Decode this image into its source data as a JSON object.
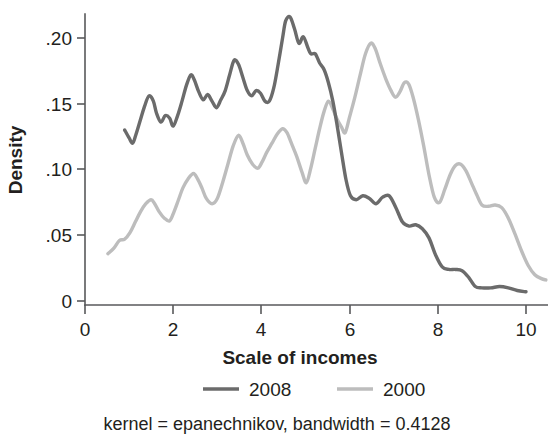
{
  "chart_data": {
    "type": "line",
    "title": "",
    "subtitle": "",
    "xlabel": "Scale of incomes",
    "ylabel": "Density",
    "caption": "kernel = epanechnikov, bandwidth = 0.4128",
    "xlim": [
      0,
      10.6
    ],
    "ylim": [
      0,
      0.225
    ],
    "grid": false,
    "legend_position": "bottom",
    "x_ticks": [
      0,
      2,
      4,
      6,
      8,
      10
    ],
    "x_tick_labels": [
      "0",
      "2",
      "4",
      "6",
      "8",
      "10"
    ],
    "y_ticks": [
      0,
      0.05,
      0.1,
      0.15,
      0.2
    ],
    "y_tick_labels": [
      "0",
      ".05",
      ".10",
      ".15",
      ".20"
    ],
    "series": [
      {
        "name": "2008",
        "color": "#6b6b6b",
        "width": 3.4,
        "x": [
          0.9,
          1.0,
          1.08,
          1.15,
          1.25,
          1.35,
          1.45,
          1.55,
          1.62,
          1.72,
          1.82,
          1.92,
          2.0,
          2.1,
          2.2,
          2.3,
          2.4,
          2.48,
          2.58,
          2.68,
          2.78,
          2.88,
          2.98,
          3.08,
          3.18,
          3.28,
          3.38,
          3.48,
          3.58,
          3.68,
          3.78,
          3.88,
          3.98,
          4.08,
          4.18,
          4.28,
          4.38,
          4.48,
          4.55,
          4.65,
          4.75,
          4.85,
          4.95,
          5.05,
          5.12,
          5.22,
          5.32,
          5.42,
          5.52,
          5.62,
          5.72,
          5.82,
          5.92,
          6.02,
          6.15,
          6.3,
          6.45,
          6.6,
          6.75,
          6.9,
          7.05,
          7.2,
          7.35,
          7.5,
          7.65,
          7.8,
          7.95,
          8.1,
          8.25,
          8.4,
          8.55,
          8.7,
          8.85,
          9.0,
          9.2,
          9.4,
          9.6,
          9.8,
          10.0
        ],
        "y": [
          0.13,
          0.124,
          0.12,
          0.126,
          0.137,
          0.148,
          0.156,
          0.152,
          0.143,
          0.136,
          0.141,
          0.139,
          0.133,
          0.141,
          0.152,
          0.164,
          0.172,
          0.168,
          0.159,
          0.153,
          0.157,
          0.152,
          0.147,
          0.153,
          0.16,
          0.172,
          0.183,
          0.18,
          0.17,
          0.16,
          0.156,
          0.16,
          0.158,
          0.152,
          0.152,
          0.162,
          0.18,
          0.2,
          0.213,
          0.216,
          0.207,
          0.196,
          0.201,
          0.193,
          0.188,
          0.188,
          0.181,
          0.176,
          0.166,
          0.152,
          0.133,
          0.112,
          0.092,
          0.08,
          0.077,
          0.08,
          0.078,
          0.074,
          0.079,
          0.08,
          0.071,
          0.06,
          0.057,
          0.058,
          0.055,
          0.048,
          0.035,
          0.026,
          0.024,
          0.024,
          0.023,
          0.018,
          0.011,
          0.01,
          0.01,
          0.011,
          0.01,
          0.008,
          0.007
        ]
      },
      {
        "name": "2000",
        "color": "#bdbdbd",
        "width": 3.4,
        "x": [
          0.52,
          0.65,
          0.78,
          0.9,
          1.02,
          1.14,
          1.26,
          1.38,
          1.5,
          1.58,
          1.68,
          1.8,
          1.92,
          2.02,
          2.12,
          2.22,
          2.34,
          2.46,
          2.55,
          2.65,
          2.75,
          2.88,
          3.0,
          3.12,
          3.24,
          3.36,
          3.48,
          3.58,
          3.68,
          3.8,
          3.92,
          4.02,
          4.12,
          4.24,
          4.36,
          4.48,
          4.58,
          4.68,
          4.8,
          4.92,
          5.02,
          5.12,
          5.22,
          5.32,
          5.42,
          5.52,
          5.62,
          5.72,
          5.82,
          5.9,
          6.0,
          6.12,
          6.24,
          6.36,
          6.48,
          6.58,
          6.7,
          6.82,
          6.94,
          7.04,
          7.14,
          7.24,
          7.34,
          7.44,
          7.56,
          7.68,
          7.8,
          7.92,
          8.04,
          8.16,
          8.28,
          8.4,
          8.52,
          8.64,
          8.76,
          8.88,
          9.0,
          9.15,
          9.3,
          9.45,
          9.6,
          9.75,
          9.9,
          10.05,
          10.2,
          10.35,
          10.45
        ],
        "y": [
          0.036,
          0.04,
          0.046,
          0.047,
          0.052,
          0.06,
          0.068,
          0.074,
          0.077,
          0.074,
          0.068,
          0.063,
          0.061,
          0.068,
          0.077,
          0.086,
          0.093,
          0.097,
          0.093,
          0.086,
          0.078,
          0.074,
          0.078,
          0.09,
          0.104,
          0.118,
          0.126,
          0.12,
          0.111,
          0.104,
          0.101,
          0.106,
          0.113,
          0.12,
          0.127,
          0.131,
          0.128,
          0.12,
          0.11,
          0.098,
          0.09,
          0.101,
          0.116,
          0.131,
          0.144,
          0.152,
          0.146,
          0.138,
          0.132,
          0.128,
          0.14,
          0.155,
          0.172,
          0.188,
          0.196,
          0.192,
          0.18,
          0.169,
          0.16,
          0.155,
          0.159,
          0.166,
          0.165,
          0.155,
          0.138,
          0.118,
          0.096,
          0.079,
          0.075,
          0.085,
          0.096,
          0.103,
          0.104,
          0.099,
          0.09,
          0.081,
          0.073,
          0.072,
          0.073,
          0.071,
          0.063,
          0.051,
          0.038,
          0.027,
          0.02,
          0.017,
          0.016
        ]
      }
    ]
  },
  "axis": {
    "y_label": "Density",
    "x_label": "Scale of incomes"
  },
  "legend": {
    "items": [
      {
        "label": "2008",
        "color": "#6b6b6b"
      },
      {
        "label": "2000",
        "color": "#bdbdbd"
      }
    ]
  },
  "caption": {
    "text": "kernel = epanechnikov, bandwidth = 0.4128"
  }
}
